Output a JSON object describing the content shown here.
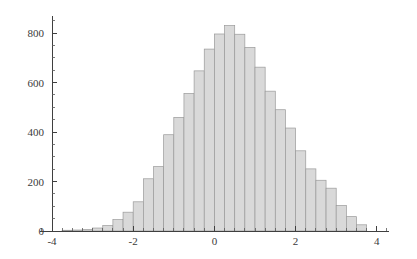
{
  "chart_data": {
    "type": "bar",
    "title": "",
    "subtitle": "",
    "xlabel": "",
    "ylabel": "",
    "legend": [],
    "grid": false,
    "legend_position": "none",
    "xlim": [
      -4.3,
      4.3
    ],
    "ylim": [
      0,
      870
    ],
    "x_ticks": [
      -4,
      -2,
      0,
      2,
      4
    ],
    "x_tick_labels": [
      "-4",
      "-2",
      "0",
      "2",
      "4"
    ],
    "x_minor_tick_step": 0.25,
    "y_ticks": [
      0,
      200,
      400,
      600,
      800
    ],
    "y_tick_labels": [
      "0",
      "200",
      "400",
      "600",
      "800"
    ],
    "y_minor_tick_step": 50,
    "bin_width": 0.25,
    "bin_left_edges": [
      -3.75,
      -3.5,
      -3.25,
      -3.0,
      -2.75,
      -2.5,
      -2.25,
      -2.0,
      -1.75,
      -1.5,
      -1.25,
      -1.0,
      -0.75,
      -0.5,
      -0.25,
      0.0,
      0.25,
      0.5,
      0.75,
      1.0,
      1.25,
      1.5,
      1.75,
      2.0,
      2.25,
      2.5,
      2.75,
      3.0,
      3.25,
      3.5
    ],
    "bin_centers": [
      -3.625,
      -3.375,
      -3.125,
      -2.875,
      -2.625,
      -2.375,
      -2.125,
      -1.875,
      -1.625,
      -1.375,
      -1.125,
      -0.875,
      -0.625,
      -0.375,
      -0.125,
      0.125,
      0.375,
      0.625,
      0.875,
      1.125,
      1.375,
      1.625,
      1.875,
      2.125,
      2.375,
      2.625,
      2.875,
      3.125,
      3.375,
      3.625
    ],
    "categories": [
      "-3.75",
      "-3.5",
      "-3.25",
      "-3.0",
      "-2.75",
      "-2.5",
      "-2.25",
      "-2.0",
      "-1.75",
      "-1.5",
      "-1.25",
      "-1.0",
      "-0.75",
      "-0.5",
      "-0.25",
      "0.0",
      "0.25",
      "0.5",
      "0.75",
      "1.0",
      "1.25",
      "1.5",
      "1.75",
      "2.0",
      "2.25",
      "2.5",
      "2.75",
      "3.0",
      "3.25",
      "3.5"
    ],
    "values": [
      3,
      4,
      6,
      12,
      22,
      46,
      76,
      118,
      211,
      260,
      389,
      459,
      556,
      647,
      735,
      796,
      830,
      795,
      742,
      662,
      565,
      490,
      416,
      324,
      251,
      205,
      173,
      103,
      58,
      25
    ],
    "bar_fill_color": "#d9d9d9",
    "bar_edge_color": "#9a9a9a",
    "axis_color": "#3f3f3f",
    "tick_label_color": "#3a3a3a",
    "background_color": "#ffffff"
  }
}
